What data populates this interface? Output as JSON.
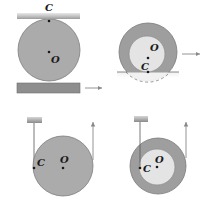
{
  "diagram": {
    "panels": [
      {
        "id": "top-left",
        "description": "Solid disk between two plates; bottom plate moves right",
        "labels": {
          "contact": "C",
          "center": "O"
        }
      },
      {
        "id": "top-right",
        "description": "Hollow wheel rolling on surface, moving right",
        "labels": {
          "contact": "C",
          "center": "O"
        }
      },
      {
        "id": "bottom-left",
        "description": "Solid disk unwinding string from fixed ceiling, pulled upward",
        "labels": {
          "contact": "C",
          "center": "O"
        }
      },
      {
        "id": "bottom-right",
        "description": "Hollow spool with string wound on inner hub, pulled upward",
        "labels": {
          "contact": "C",
          "center": "O"
        }
      }
    ],
    "colors": {
      "disk_fill": "#a9a9a9",
      "disk_stroke": "#7a7a7a",
      "inner_fill": "#e6e6e6",
      "plate_top": "#c8c8c8",
      "plate_bottom": "#8e8e8e",
      "arrow": "#888888",
      "ink": "#1a1a1a"
    }
  }
}
